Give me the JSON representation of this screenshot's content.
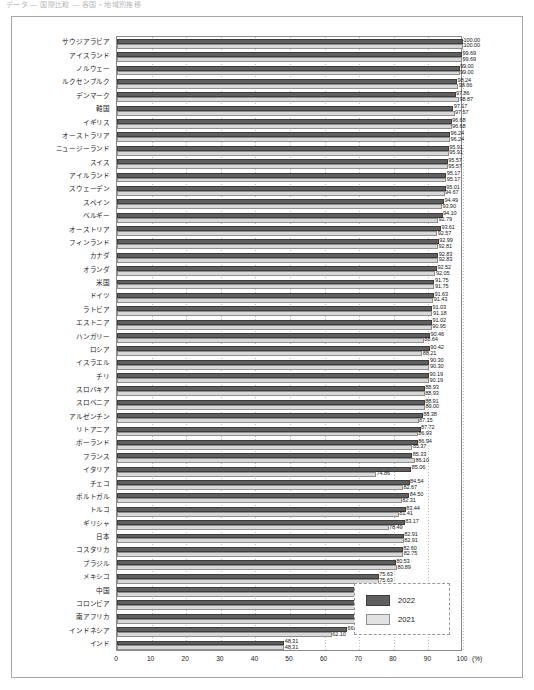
{
  "top_strip": {
    "cropped_header_text": "データ  ―  国際比較  ―  各国・地域別推移"
  },
  "legend": {
    "position": "bottom-right",
    "items": [
      {
        "label": "2022",
        "color": "#5f5f5f",
        "key": "y2022"
      },
      {
        "label": "2021",
        "color": "#e2e2e2",
        "key": "y2021"
      }
    ]
  },
  "axis": {
    "unit": "(%)",
    "ticks": [
      "0",
      "10",
      "20",
      "30",
      "40",
      "50",
      "60",
      "70",
      "80",
      "90",
      "100"
    ]
  },
  "chart_data": {
    "type": "bar",
    "orientation": "horizontal",
    "title": "",
    "subtitle": "",
    "xlabel": "(%)",
    "ylabel": "",
    "xlim": [
      0,
      100
    ],
    "grid": true,
    "legend_position": "bottom-right",
    "value_format": "2 decimals",
    "categories": [
      "サウジアラビア",
      "アイスランド",
      "ノルウェー",
      "ルクセンブルク",
      "デンマーク",
      "韓国",
      "イギリス",
      "オーストラリア",
      "ニュージーランド",
      "スイス",
      "アイルランド",
      "スウェーデン",
      "スペイン",
      "ベルギー",
      "オーストリア",
      "フィンランド",
      "カナダ",
      "オランダ",
      "米国",
      "ドイツ",
      "ラトビア",
      "エストニア",
      "ハンガリー",
      "ロシア",
      "イスラエル",
      "チリ",
      "スロバキア",
      "スロベニア",
      "アルゼンチン",
      "リトアニア",
      "ポーランド",
      "フランス",
      "イタリア",
      "チェコ",
      "ポルトガル",
      "トルコ",
      "ギリシャ",
      "日本",
      "コスタリカ",
      "ブラジル",
      "メキシコ",
      "中国",
      "コロンビア",
      "南アフリカ",
      "インドネシア",
      "インド"
    ],
    "series": [
      {
        "name": "2022",
        "color": "#5f5f5f",
        "values": [
          100.0,
          99.69,
          99.0,
          98.24,
          97.86,
          97.17,
          96.68,
          96.24,
          95.91,
          95.57,
          95.17,
          95.01,
          94.49,
          94.1,
          93.61,
          92.99,
          92.83,
          92.52,
          91.75,
          91.63,
          91.03,
          91.02,
          90.46,
          90.42,
          90.3,
          90.19,
          88.93,
          88.91,
          88.38,
          87.72,
          86.94,
          85.33,
          85.06,
          84.54,
          84.5,
          83.44,
          83.17,
          82.91,
          82.6,
          80.53,
          75.63,
          75.61,
          73.93,
          72.31,
          66.48,
          48.31
        ]
      },
      {
        "name": "2021",
        "color": "#e2e2e2",
        "values": [
          100.0,
          99.69,
          99.0,
          98.66,
          98.87,
          97.57,
          96.68,
          96.24,
          95.91,
          95.57,
          95.17,
          94.67,
          93.9,
          92.79,
          92.57,
          92.81,
          92.83,
          92.05,
          91.75,
          91.43,
          91.18,
          90.95,
          88.64,
          88.21,
          90.3,
          90.19,
          88.93,
          89.0,
          87.15,
          86.93,
          85.37,
          86.1,
          74.86,
          82.67,
          82.31,
          81.41,
          78.49,
          82.91,
          82.75,
          80.89,
          75.63,
          73.05,
          73.05,
          72.31,
          62.1,
          48.31
        ]
      }
    ]
  }
}
